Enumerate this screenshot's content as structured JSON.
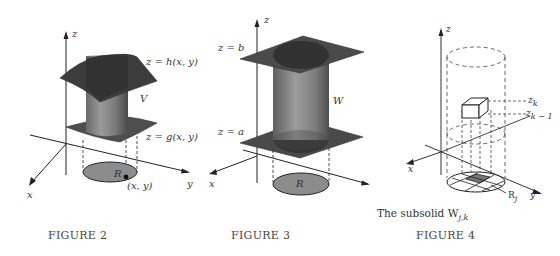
{
  "figures": [
    {
      "id": "figure-2",
      "caption": "FIGURE 2",
      "labels": {
        "z_axis": "z",
        "x_axis": "x",
        "y_axis": "y",
        "top_surface": "z = h(x, y)",
        "bottom_surface": "z = g(x, y)",
        "solid": "V",
        "region": "R",
        "point": "(x, y)"
      }
    },
    {
      "id": "figure-3",
      "caption": "FIGURE 3",
      "labels": {
        "z_axis": "z",
        "x_axis": "x",
        "y_axis": "y",
        "top_plane": "z = b",
        "bottom_plane": "z = a",
        "solid": "W",
        "region": "R"
      }
    },
    {
      "id": "figure-4",
      "caption": "FIGURE 4",
      "subcaption": "The subsolid W",
      "subcaption_sub": "j,k",
      "labels": {
        "z_axis": "z",
        "x_axis": "x",
        "y_axis": "y",
        "upper_level": "z",
        "upper_level_sub": "k",
        "lower_level": "z",
        "lower_level_sub": "k − 1",
        "subregion": "R",
        "subregion_sub": "j"
      }
    }
  ],
  "colors": {
    "surface_dark": "#3a3a3a",
    "surface_mid": "#5a5a5a",
    "cylinder": "#8a8a8a",
    "region_fill": "#8c8c8c",
    "line": "#222222",
    "text": "#333333"
  }
}
